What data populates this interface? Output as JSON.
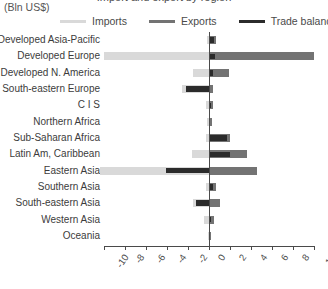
{
  "header": {
    "title": "Import and export by region",
    "subtitle": "(Bln US$)"
  },
  "legend": {
    "position": "top",
    "items": [
      {
        "label": "Imports",
        "color": "#d9d9d9",
        "name": "legend-imports"
      },
      {
        "label": "Exports",
        "color": "#737373",
        "name": "legend-exports"
      },
      {
        "label": "Trade balance",
        "color": "#2b2b2b",
        "name": "legend-trade-balance"
      }
    ]
  },
  "axis": {
    "ticks": [
      "-10",
      "-8",
      "-6",
      "-4",
      "-2",
      "0",
      "2",
      "4",
      "6",
      "8",
      "10"
    ],
    "min": -10,
    "max": 10,
    "step": 2,
    "rotated": true
  },
  "chart_data": {
    "type": "bar",
    "orientation": "horizontal",
    "title": "Import and export by region",
    "subtitle": "(Bln US$)",
    "xlabel": "",
    "ylabel": "",
    "xlim": [
      -10,
      10
    ],
    "grid": false,
    "legend_position": "top",
    "categories": [
      "Developed Asia-Pacific",
      "Developed Europe",
      "Developed N. America",
      "South-eastern Europe",
      "C I S",
      "Northern Africa",
      "Sub-Saharan Africa",
      "Latin Am, Caribbean",
      "Eastern Asia",
      "Southern Asia",
      "South-eastern Asia",
      "Western Asia",
      "Oceania"
    ],
    "series": [
      {
        "name": "Imports",
        "color": "#d9d9d9",
        "values": [
          -0.2,
          -10.0,
          -1.5,
          -2.6,
          -0.3,
          -0.2,
          -0.3,
          -1.6,
          -10.4,
          -0.3,
          -1.5,
          -0.5,
          -0.1
        ]
      },
      {
        "name": "Exports",
        "color": "#737373",
        "values": [
          0.7,
          10.0,
          1.9,
          0.4,
          0.4,
          0.3,
          2.0,
          3.6,
          4.6,
          0.7,
          1.0,
          0.5,
          0.2
        ]
      },
      {
        "name": "Trade balance",
        "color": "#2b2b2b",
        "values": [
          0.5,
          0.6,
          0.4,
          -2.2,
          0.2,
          0.1,
          1.7,
          2.0,
          -4.1,
          0.4,
          -1.2,
          0.2,
          0.1
        ]
      }
    ]
  }
}
